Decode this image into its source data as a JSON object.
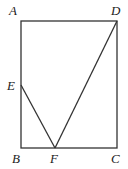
{
  "diagram": {
    "type": "geometry",
    "points": {
      "A": {
        "label": "A",
        "x": 21,
        "y": 21,
        "lx": 9,
        "ly": 15
      },
      "D": {
        "label": "D",
        "x": 117,
        "y": 21,
        "lx": 111,
        "ly": 15
      },
      "E": {
        "label": "E",
        "x": 21,
        "y": 85,
        "lx": 7,
        "ly": 90
      },
      "B": {
        "label": "B",
        "x": 21,
        "y": 148,
        "lx": 12,
        "ly": 163
      },
      "F": {
        "label": "F",
        "x": 55,
        "y": 148,
        "lx": 50,
        "ly": 163
      },
      "C": {
        "label": "C",
        "x": 117,
        "y": 148,
        "lx": 111,
        "ly": 163
      }
    },
    "segments": [
      "AD",
      "AB",
      "BC",
      "CD",
      "DF",
      "EF"
    ]
  }
}
